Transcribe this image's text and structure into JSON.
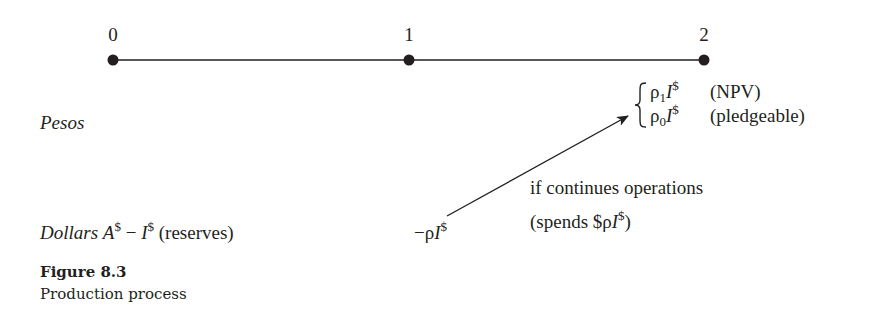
{
  "timeline": {
    "ticks": [
      {
        "label": "0",
        "x": 113
      },
      {
        "label": "1",
        "x": 409
      },
      {
        "label": "2",
        "x": 704
      }
    ],
    "line_color": "#231f20"
  },
  "rows": {
    "pesos": {
      "label": "Pesos",
      "outcomes": [
        {
          "rho": "ρ",
          "sub": "1",
          "I": "I",
          "sup": "$",
          "note": "(NPV)"
        },
        {
          "rho": "ρ",
          "sub": "0",
          "I": "I",
          "sup": "$",
          "note": "(pledgeable)"
        }
      ]
    },
    "dollars": {
      "label": "Dollars",
      "A": "A",
      "A_sup": "$",
      "minus": " − ",
      "I": "I",
      "I_sup": "$",
      "note": " (reserves)",
      "t1_prefix": "−ρ",
      "t1_I": "I",
      "t1_sup": "$"
    }
  },
  "arrow_annotation": {
    "line1": "if continues operations",
    "line2_prefix": "(spends $ρ",
    "line2_I": "I",
    "line2_sup": "$",
    "line2_suffix": ")"
  },
  "caption": {
    "title": "Figure 8.3",
    "subtitle": "Production process"
  }
}
